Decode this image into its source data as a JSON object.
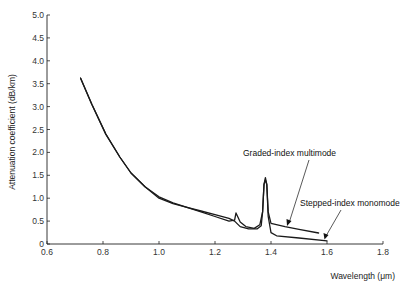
{
  "chart_data": {
    "type": "line",
    "title": "",
    "xlabel": "Wavelength (μm)",
    "ylabel": "Attenuation coefficient (dB/km)",
    "xlim": [
      0.6,
      1.8
    ],
    "ylim": [
      0,
      5.0
    ],
    "x_ticks": [
      "0.6",
      "0.8",
      "1.0",
      "1.2",
      "1.4",
      "1.6",
      "1.8"
    ],
    "y_ticks": [
      "0",
      "0.5",
      "1.0",
      "1.5",
      "2.0",
      "2.5",
      "3.0",
      "3.5",
      "4.0",
      "4.5",
      "5.0"
    ],
    "grid": false,
    "legend": "none (curves labelled by annotations with arrows)",
    "series": [
      {
        "name": "Graded-index multimode",
        "points": [
          [
            0.72,
            3.62
          ],
          [
            0.76,
            3.05
          ],
          [
            0.81,
            2.4
          ],
          [
            0.86,
            1.9
          ],
          [
            0.9,
            1.55
          ],
          [
            0.95,
            1.25
          ],
          [
            1.0,
            1.03
          ],
          [
            1.05,
            0.9
          ],
          [
            1.1,
            0.8
          ],
          [
            1.15,
            0.7
          ],
          [
            1.2,
            0.6
          ],
          [
            1.25,
            0.5
          ],
          [
            1.27,
            0.52
          ],
          [
            1.275,
            0.68
          ],
          [
            1.29,
            0.48
          ],
          [
            1.31,
            0.38
          ],
          [
            1.34,
            0.34
          ],
          [
            1.36,
            0.42
          ],
          [
            1.37,
            0.7
          ],
          [
            1.375,
            1.3
          ],
          [
            1.38,
            1.4
          ],
          [
            1.385,
            1.3
          ],
          [
            1.39,
            0.7
          ],
          [
            1.4,
            0.45
          ],
          [
            1.45,
            0.38
          ],
          [
            1.5,
            0.32
          ],
          [
            1.57,
            0.24
          ]
        ]
      },
      {
        "name": "Stepped-index monomode",
        "points": [
          [
            0.72,
            3.62
          ],
          [
            0.76,
            3.05
          ],
          [
            0.81,
            2.4
          ],
          [
            0.86,
            1.9
          ],
          [
            0.9,
            1.55
          ],
          [
            0.95,
            1.25
          ],
          [
            1.0,
            1.0
          ],
          [
            1.05,
            0.88
          ],
          [
            1.1,
            0.8
          ],
          [
            1.15,
            0.72
          ],
          [
            1.2,
            0.64
          ],
          [
            1.25,
            0.56
          ],
          [
            1.27,
            0.5
          ],
          [
            1.29,
            0.38
          ],
          [
            1.32,
            0.33
          ],
          [
            1.35,
            0.33
          ],
          [
            1.365,
            0.4
          ],
          [
            1.37,
            0.7
          ],
          [
            1.375,
            1.3
          ],
          [
            1.38,
            1.45
          ],
          [
            1.385,
            1.3
          ],
          [
            1.39,
            0.6
          ],
          [
            1.4,
            0.25
          ],
          [
            1.42,
            0.18
          ],
          [
            1.5,
            0.13
          ],
          [
            1.6,
            0.07
          ]
        ]
      }
    ],
    "annotations": [
      {
        "text": "Graded-index multimode",
        "points_to": [
          1.47,
          0.36
        ]
      },
      {
        "text": "Stepped-index monomode",
        "points_to": [
          1.59,
          0.09
        ]
      }
    ]
  },
  "labels": {
    "ylabel": "Attenuation coefficient (dB/km)",
    "xlabel": "Wavelength (μm)",
    "graded": "Graded-index multimode",
    "stepped": "Stepped-index monomode"
  }
}
